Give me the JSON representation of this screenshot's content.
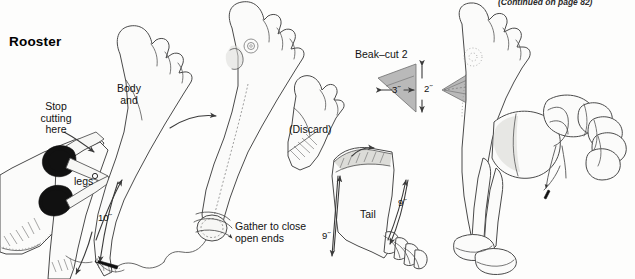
{
  "page": {
    "title": "Rooster",
    "continued_note": "(Continued on page 82)",
    "background_color": "#fdfdfc",
    "ink_color": "#3a3a3a",
    "fill_light": "#fbfbfa",
    "fill_gray": "#b9b9b9",
    "fill_shadow": "#d9d9d6"
  },
  "labels": {
    "stop_cutting": "Stop\ncutting\nhere",
    "body_and": "Body\nand",
    "legs": "legs",
    "length_10": "10˝",
    "discard": "(Discard)",
    "beak": "Beak–cut 2",
    "beak_width_3": "3˝",
    "beak_height_2": "2˝",
    "gather": "Gather to close\nopen ends",
    "tail": "Tail",
    "tail_len_left": "9˝",
    "tail_len_right": "9˝"
  },
  "figures": [
    {
      "name": "scissors-cutting-sock",
      "caption": "Stop cutting here"
    },
    {
      "name": "sock-body-and-legs",
      "caption": "Body and legs"
    },
    {
      "name": "sock-gathered-open-ends",
      "caption": "Gather to close open ends"
    },
    {
      "name": "discard-piece",
      "caption": "(Discard)"
    },
    {
      "name": "tail-sock-piece",
      "caption": "Tail"
    },
    {
      "name": "beak-triangle-flat",
      "caption": "Beak–cut 2"
    },
    {
      "name": "beak-cone-sewn",
      "caption": "Beak"
    },
    {
      "name": "finished-rooster",
      "caption": "Rooster"
    }
  ]
}
